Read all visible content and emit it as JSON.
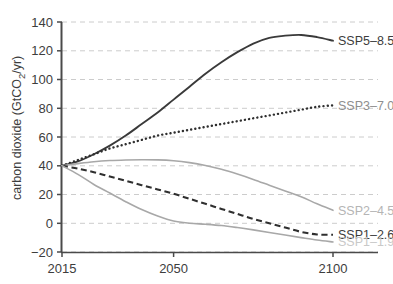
{
  "chart_data": {
    "type": "line",
    "title": "",
    "xlabel": "",
    "ylabel": "carbon dioxide (GtCO₂/yr)",
    "ylabel_parts": {
      "pre": "carbon dioxide (GtCO",
      "sub": "2",
      "post": "/yr)"
    },
    "xlim": [
      2015,
      2100
    ],
    "ylim": [
      -20,
      140
    ],
    "grid": true,
    "grid_axis": "y",
    "legend_position": "right-inline",
    "xticks": [
      2015,
      2050,
      2100
    ],
    "xtick_labels": [
      "2015",
      "2050",
      "2100"
    ],
    "yticks": [
      -20,
      0,
      20,
      40,
      60,
      80,
      100,
      120,
      140
    ],
    "ytick_labels": [
      "−20",
      "0",
      "20",
      "40",
      "60",
      "80",
      "100",
      "120",
      "140"
    ],
    "x": [
      2015,
      2020,
      2025,
      2030,
      2035,
      2040,
      2045,
      2050,
      2055,
      2060,
      2065,
      2070,
      2075,
      2080,
      2085,
      2090,
      2095,
      2100
    ],
    "series": [
      {
        "name": "SSP5–8.5",
        "label": "SSP5–8.5",
        "color": "#3a3a3a",
        "style": "solid",
        "width": 1.9,
        "label_color": "#3d3d3d",
        "label_value_y": 127,
        "values": [
          40,
          43,
          48,
          54,
          61,
          69,
          77,
          86,
          95,
          104,
          112,
          119,
          125,
          129,
          130.5,
          131,
          129.5,
          127
        ]
      },
      {
        "name": "SSP3–7.0",
        "label": "SSP3–7.0",
        "color": "#2f2f2f",
        "style": "dotted",
        "width": 2.4,
        "label_color": "#8e8e8e",
        "label_value_y": 82,
        "values": [
          40,
          44,
          48,
          52,
          55,
          58,
          61,
          63,
          65,
          67,
          69,
          71,
          73,
          75,
          77,
          79,
          81,
          82
        ]
      },
      {
        "name": "SSP2–4.5",
        "label": "SSP2–4.5",
        "color": "#a8a8a8",
        "style": "solid",
        "width": 1.6,
        "label_color": "#b5b5b5",
        "label_value_y": 9,
        "values": [
          40,
          41.5,
          42.8,
          43.6,
          44,
          44.2,
          44.1,
          43.5,
          42.2,
          40.2,
          37.5,
          34.2,
          30.5,
          26.5,
          22.5,
          18.5,
          13.5,
          9
        ]
      },
      {
        "name": "SSP1–2.6",
        "label": "SSP1–2.6",
        "color": "#2f2f2f",
        "style": "dashed",
        "width": 2.1,
        "label_color": "#3d3d3d",
        "label_value_y": -8,
        "values": [
          40,
          38,
          35.5,
          32.5,
          29.5,
          26.5,
          23.5,
          20.5,
          17,
          13.5,
          10,
          6.5,
          3,
          0,
          -3,
          -6,
          -7.8,
          -8
        ]
      },
      {
        "name": "SSP1–1.9",
        "label": "SSP1–1.9",
        "color": "#a8a8a8",
        "style": "solid",
        "width": 1.6,
        "label_color": "#c9c9c9",
        "label_value_y": -13,
        "values": [
          40,
          34,
          27,
          21,
          15,
          9.5,
          5,
          1.5,
          0,
          -0.7,
          -1.6,
          -3,
          -4.6,
          -6.4,
          -8.2,
          -10,
          -11.7,
          -13
        ]
      }
    ]
  },
  "axis": {
    "y_title": "carbon dioxide (GtCO2/yr)"
  }
}
